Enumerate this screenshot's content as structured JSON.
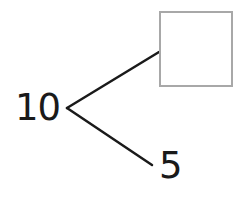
{
  "diagram": {
    "type": "number-bond",
    "whole": "10",
    "parts": [
      {
        "value": "",
        "kind": "empty-box"
      },
      {
        "value": "5",
        "kind": "number"
      }
    ],
    "colors": {
      "text": "#1a1a1a",
      "line": "#1a1a1a",
      "box_border": "#a8a8a8",
      "background": "#ffffff"
    }
  }
}
